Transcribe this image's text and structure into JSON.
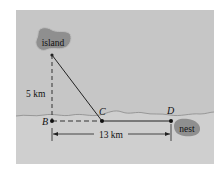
{
  "diagram": {
    "labels": {
      "island": "island",
      "nest": "nest",
      "vertical_distance": "5 km",
      "horizontal_distance": "13 km",
      "point_b": "B",
      "point_c": "C",
      "point_d": "D"
    },
    "colors": {
      "panel_sky": "#c4c4c4",
      "panel_ground": "#cfcfcf",
      "blob": "#8f8f8f",
      "line": "#222222"
    }
  }
}
